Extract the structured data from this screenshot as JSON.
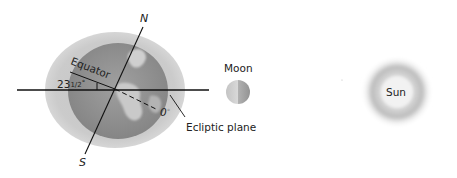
{
  "diagram": {
    "earth": {
      "north_label": "N",
      "south_label": "S",
      "equator_label": "Equator",
      "tilt_label_whole": "23",
      "tilt_label_frac": "1/2",
      "tilt_label_deg": "°",
      "zero_label": "0",
      "zero_deg": "°",
      "ecliptic_label": "Ecliptic plane"
    },
    "moon": {
      "label": "Moon"
    },
    "sun": {
      "label": "Sun"
    },
    "colors": {
      "halo": "#c8c8c8",
      "globe": "#8f8f8f",
      "land": "#bdbdbd",
      "line": "#111111",
      "moon_light": "#d8d8d8",
      "moon_dark": "#9a9a9a",
      "sun": "#b5b5b5"
    }
  }
}
